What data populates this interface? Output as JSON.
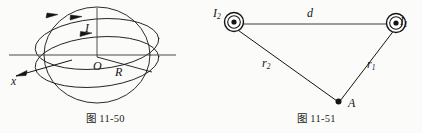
{
  "page": {
    "background": "#fbfbfa",
    "ink": "#141414"
  },
  "figures": [
    {
      "id": "figure-left",
      "caption": "图 11-50",
      "description": "spherical current loop with axis",
      "labels": {
        "current": "I",
        "center": "O",
        "radius": "R",
        "axis": "x"
      }
    },
    {
      "id": "figure-right",
      "caption": "图 11-51",
      "description": "two parallel wires out of page and field point A",
      "labels": {
        "current_left": "I",
        "current_left_sub": "2",
        "current_right": "I",
        "current_right_sub": "1",
        "separation": "d",
        "distance_left": "r",
        "distance_left_sub": "2",
        "distance_right": "r",
        "distance_right_sub": "1",
        "point": "A"
      }
    }
  ]
}
